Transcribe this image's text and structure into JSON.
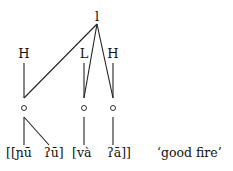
{
  "diagram": {
    "root_node": "l",
    "tones": [
      {
        "label": "H",
        "x": 24
      },
      {
        "label": "L",
        "x": 84
      },
      {
        "label": "H",
        "x": 113
      }
    ],
    "segments": {
      "first_word": "[[ɲū",
      "first_word_b": "ʔū]",
      "second_word": "[và",
      "second_word_b": "ʔā]]"
    },
    "gloss": "‘good fire’",
    "line_color": "#222222"
  }
}
